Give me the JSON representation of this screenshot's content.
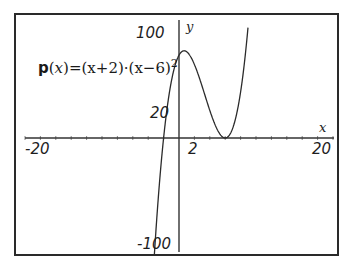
{
  "chart_data": {
    "type": "line",
    "title": "",
    "function_label": "p(x)=(x+2)·(x−6)^2",
    "function": {
      "name": "p",
      "expression": "(x+2)*(x-6)^2",
      "roots": [
        -2,
        6
      ],
      "local_max": {
        "x": 0.667,
        "y": 75.85
      },
      "local_min": {
        "x": 6,
        "y": 0
      },
      "y_intercept": 72
    },
    "xlabel": "x",
    "ylabel": "y",
    "xlim": [
      -20,
      20
    ],
    "ylim": [
      -100,
      100
    ],
    "x_tick_labels": [
      "-20",
      "2",
      "20"
    ],
    "y_tick_labels": [
      "100",
      "20",
      "-100"
    ],
    "x_minor_tick_step": 2,
    "grid": false,
    "legend": null
  },
  "labels": {
    "x_axis_name": "x",
    "y_axis_name": "y",
    "x_min": "-20",
    "x_tick": "2",
    "x_max": "20",
    "y_max": "100",
    "y_tick": "20",
    "y_min": "-100",
    "formula_name": "p",
    "formula_open": "(",
    "formula_var": "x",
    "formula_rest": ")=(x+2)·(x−6)",
    "formula_exp": "2"
  },
  "colors": {
    "frame": "#2a2a2a",
    "axis": "#333333",
    "curve": "#2b2b2b",
    "background": "#ffffff"
  }
}
